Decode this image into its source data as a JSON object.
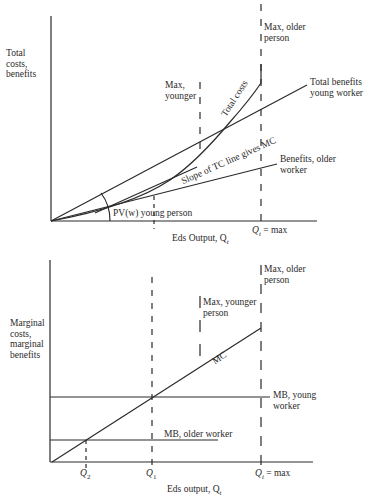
{
  "top_chart": {
    "y_axis_label": [
      "Total",
      "costs,",
      "benefits"
    ],
    "x_axis_label": "Eds Output, Q",
    "x_axis_label_sub": "t",
    "tick_qt_label": "Q",
    "tick_qt_sub": "t",
    "tick_qt_suffix": " = max",
    "max_older_label": [
      "Max, older",
      "person"
    ],
    "max_younger_label": [
      "Max,",
      "younger"
    ],
    "total_costs_label": "Total costs",
    "total_benefits_young_label": [
      "Total benefits",
      "young worker"
    ],
    "benefits_older_label": [
      "Benefits, older",
      "worker"
    ],
    "slope_label": "Slope of TC line gives MC",
    "pv_label": "PV(w) young person"
  },
  "bottom_chart": {
    "y_axis_label": [
      "Marginal",
      "costs,",
      "marginal",
      "benefits"
    ],
    "x_axis_label": "Eds output, Q",
    "x_axis_label_sub": "t",
    "tick_q2_label": "Q",
    "tick_q2_sub": "2",
    "tick_q1_label": "Q",
    "tick_q1_sub": "1",
    "tick_qt_label": "Q",
    "tick_qt_sub": "t",
    "tick_qt_suffix": " = max",
    "max_older_label": [
      "Max, older",
      "person"
    ],
    "max_younger_label": [
      "Max, younger",
      "person"
    ],
    "mc_label": "MC",
    "mb_young_label": [
      "MB, young",
      "worker"
    ],
    "mb_older_label": "MB, older worker"
  }
}
